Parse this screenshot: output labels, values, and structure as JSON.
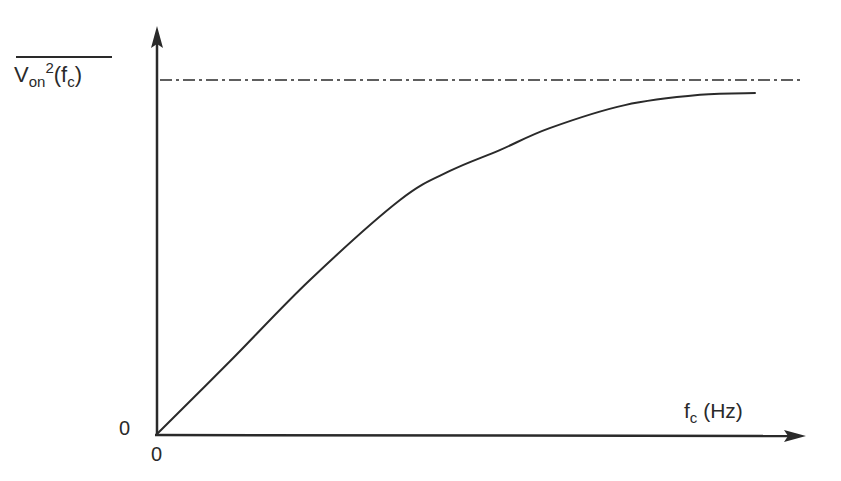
{
  "chart_data": {
    "type": "line",
    "title": "",
    "xlabel": "f_c (Hz)",
    "ylabel": "V_on^2(f_c) (mean, overbar)",
    "x_tick_labels": [
      "0"
    ],
    "y_tick_labels": [
      "0"
    ],
    "asymptote": {
      "label": "V_on^2(f_c)",
      "value": 1.0,
      "style": "dash-dot"
    },
    "grid": false,
    "legend": null,
    "xlim": [
      0,
      1
    ],
    "ylim": [
      0,
      1.1
    ],
    "series": [
      {
        "name": "V_on^2 vs f_c",
        "x": [
          0,
          0.113,
          0.236,
          0.375,
          0.452,
          0.529,
          0.606,
          0.722,
          0.838,
          0.924
        ],
        "y": [
          0,
          0.206,
          0.435,
          0.661,
          0.743,
          0.802,
          0.864,
          0.929,
          0.958,
          0.963
        ]
      }
    ]
  },
  "labels": {
    "y_main": "V",
    "y_sub": "on",
    "y_sup": "2",
    "y_paren_open": "(f",
    "y_paren_sub": "c",
    "y_paren_close": ")",
    "x_main": "f",
    "x_sub": "c",
    "x_unit": " (Hz)",
    "y_zero": "0",
    "x_zero": "0"
  },
  "colors": {
    "ink": "#2a2a2a",
    "background": "#ffffff"
  }
}
